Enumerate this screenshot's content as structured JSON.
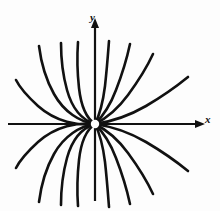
{
  "figure": {
    "kind": "math-figure",
    "background_color": "#fdfdfd",
    "ink_color": "#111111",
    "x_axis_label": "x",
    "y_axis_label": "y",
    "origin_marker": "open-circle-hole"
  },
  "chart_data": {
    "type": "line",
    "title": "",
    "xlabel": "x",
    "ylabel": "y",
    "grid": false,
    "legend": null,
    "axis_style": "arrowed-cartesian-axes",
    "origin": {
      "x": 0,
      "y": 0,
      "marker": "open circle (point excluded)"
    },
    "xlim": [
      -1.0,
      1.0
    ],
    "ylim": [
      -1.0,
      1.0
    ],
    "series": [
      {
        "name": "branch-up-left-4",
        "start_angle_deg": 180,
        "end_angle_deg": 150,
        "curvature": "concave-up"
      },
      {
        "name": "branch-up-left-3",
        "start_angle_deg": 180,
        "end_angle_deg": 118,
        "curvature": "concave-up"
      },
      {
        "name": "branch-up-left-2",
        "start_angle_deg": 180,
        "end_angle_deg": 100,
        "curvature": "concave-up"
      },
      {
        "name": "branch-up-left-1",
        "start_angle_deg": 180,
        "end_angle_deg": 92,
        "curvature": "concave-up"
      },
      {
        "name": "branch-up-right-1",
        "start_angle_deg": 0,
        "end_angle_deg": 88,
        "curvature": "concave-up"
      },
      {
        "name": "branch-up-right-2",
        "start_angle_deg": 0,
        "end_angle_deg": 80,
        "curvature": "concave-up"
      },
      {
        "name": "branch-up-right-3",
        "start_angle_deg": 0,
        "end_angle_deg": 62,
        "curvature": "concave-up"
      },
      {
        "name": "branch-up-right-4",
        "start_angle_deg": 0,
        "end_angle_deg": 30,
        "curvature": "concave-up"
      },
      {
        "name": "branch-dn-left-4",
        "start_angle_deg": 180,
        "end_angle_deg": 210,
        "curvature": "concave-down"
      },
      {
        "name": "branch-dn-left-3",
        "start_angle_deg": 180,
        "end_angle_deg": 242,
        "curvature": "concave-down"
      },
      {
        "name": "branch-dn-left-2",
        "start_angle_deg": 180,
        "end_angle_deg": 260,
        "curvature": "concave-down"
      },
      {
        "name": "branch-dn-left-1",
        "start_angle_deg": 180,
        "end_angle_deg": 268,
        "curvature": "concave-down"
      },
      {
        "name": "branch-dn-right-1",
        "start_angle_deg": 0,
        "end_angle_deg": 272,
        "curvature": "concave-down"
      },
      {
        "name": "branch-dn-right-2",
        "start_angle_deg": 0,
        "end_angle_deg": 280,
        "curvature": "concave-down"
      },
      {
        "name": "branch-dn-right-3",
        "start_angle_deg": 0,
        "end_angle_deg": 298,
        "curvature": "concave-down"
      },
      {
        "name": "branch-dn-right-4",
        "start_angle_deg": 0,
        "end_angle_deg": 330,
        "curvature": "concave-down"
      }
    ],
    "geometry_px": {
      "origin_px": {
        "x": 95,
        "y": 124
      },
      "hole_radius_px": 4.2,
      "x_axis": {
        "x1": 8,
        "x2": 203,
        "y": 124
      },
      "y_axis": {
        "y1": 22,
        "y2": 201,
        "x": 95
      },
      "curves": [
        "M 95 124 C 78 126 56 122 38 106 C 26 95 20 88 16 80",
        "M 95 124 C 80 122 64 112 54 94 C 45 78 41 62 39 46",
        "M 95 124 C 82 120 72 108 67 90 C 62 72 61 58 61 43",
        "M 95 124 C 86 118 81 106 79 88 C 77 70 77 56 78 42",
        "M 95 124 C 99 116 103 102 105 86 C 107 68 108 54 109 41",
        "M 95 124 C 102 117 110 106 116 90 C 123 72 127 58 130 44",
        "M 95 124 C 105 119 117 110 128 95 C 139 80 147 67 153 54",
        "M 95 124 C 109 122 127 117 146 106 C 163 96 177 86 188 77",
        "M 95 124 C 78 122 56 126 38 142 C 26 153 20 160 16 168",
        "M 95 124 C 80 126 64 136 54 154 C 45 170 41 186 39 202",
        "M 95 124 C 82 128 72 140 67 158 C 62 176 61 190 61 205",
        "M 95 124 C 86 130 81 142 79 160 C 77 178 77 192 78 206",
        "M 95 124 C 99 132 103 146 105 162 C 107 180 108 194 109 207",
        "M 95 124 C 102 131 110 142 116 158 C 123 176 127 190 130 204",
        "M 95 124 C 105 129 117 138 128 153 C 139 168 147 181 153 194",
        "M 95 124 C 109 126 127 131 146 142 C 163 152 177 162 188 171"
      ]
    }
  }
}
